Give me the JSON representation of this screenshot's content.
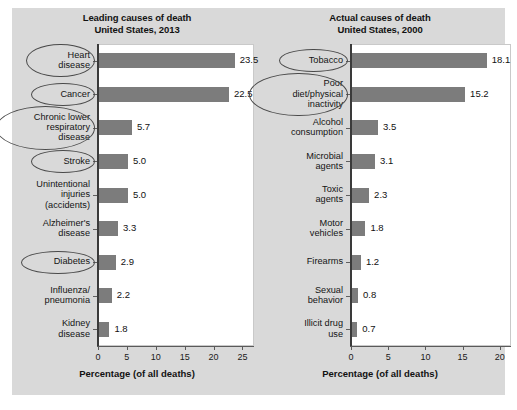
{
  "figure": {
    "panel_color": "#d9d9d9",
    "bar_color": "#7c7c7c",
    "plot_background": "#ffffff",
    "annotation_color": "#4a4a4a"
  },
  "charts": [
    {
      "id": "leading-causes",
      "title_line1": "Leading causes of death",
      "title_line2": "United States, 2013",
      "xlabel": "Percentage (of all deaths)",
      "ticks": [
        "0",
        "5",
        "10",
        "15",
        "20",
        "25"
      ],
      "categories": [
        "Heart disease",
        "Cancer",
        "Chronic lower respiratory disease",
        "Stroke",
        "Unintentional injuries (accidents)",
        "Alzheimer's disease",
        "Diabetes",
        "Influenza/ pneumonia",
        "Kidney disease"
      ],
      "label_lines": [
        [
          "Heart",
          "disease"
        ],
        [
          "Cancer"
        ],
        [
          "Chronic lower",
          "respiratory",
          "disease"
        ],
        [
          "Stroke"
        ],
        [
          "Unintentional",
          "injuries",
          "(accidents)"
        ],
        [
          "Alzheimer's",
          "disease"
        ],
        [
          "Diabetes"
        ],
        [
          "Influenza/",
          "pneumonia"
        ],
        [
          "Kidney",
          "disease"
        ]
      ],
      "values": [
        "23.5",
        "22.5",
        "5.7",
        "5.0",
        "5.0",
        "3.3",
        "2.9",
        "2.2",
        "1.8"
      ],
      "circled": [
        true,
        true,
        true,
        true,
        false,
        false,
        true,
        false,
        false
      ]
    },
    {
      "id": "actual-causes",
      "title_line1": "Actual causes of death",
      "title_line2": "United States, 2000",
      "xlabel": "Percentage (of all deaths)",
      "ticks": [
        "0",
        "5",
        "10",
        "15",
        "20"
      ],
      "categories": [
        "Tobacco",
        "Poor diet/physical inactivity",
        "Alcohol consumption",
        "Microbial agents",
        "Toxic agents",
        "Motor vehicles",
        "Firearms",
        "Sexual behavior",
        "Illicit drug use"
      ],
      "label_lines": [
        [
          "Tobacco"
        ],
        [
          "Poor",
          "diet/physical",
          "inactivity"
        ],
        [
          "Alcohol",
          "consumption"
        ],
        [
          "Microbial",
          "agents"
        ],
        [
          "Toxic",
          "agents"
        ],
        [
          "Motor",
          "vehicles"
        ],
        [
          "Firearms"
        ],
        [
          "Sexual",
          "behavior"
        ],
        [
          "Illicit drug",
          "use"
        ]
      ],
      "values": [
        "18.1",
        "15.2",
        "3.5",
        "3.1",
        "2.3",
        "1.8",
        "1.2",
        "0.8",
        "0.7"
      ],
      "circled": [
        true,
        true,
        false,
        false,
        false,
        false,
        false,
        false,
        false
      ]
    }
  ],
  "chart_data": [
    {
      "type": "bar",
      "orientation": "horizontal",
      "title": "Leading causes of death United States, 2013",
      "xlabel": "Percentage (of all deaths)",
      "ylabel": "",
      "xlim": [
        0,
        27
      ],
      "xticks": [
        0,
        5,
        10,
        15,
        20,
        25
      ],
      "grid": false,
      "legend": false,
      "categories": [
        "Heart disease",
        "Cancer",
        "Chronic lower respiratory disease",
        "Stroke",
        "Unintentional injuries (accidents)",
        "Alzheimer's disease",
        "Diabetes",
        "Influenza/pneumonia",
        "Kidney disease"
      ],
      "values": [
        23.5,
        22.5,
        5.7,
        5.0,
        5.0,
        3.3,
        2.9,
        2.2,
        1.8
      ],
      "data_labels": [
        "23.5",
        "22.5",
        "5.7",
        "5.0",
        "5.0",
        "3.3",
        "2.9",
        "2.2",
        "1.8"
      ],
      "annotations": [
        "ellipse around Heart disease",
        "ellipse around Cancer",
        "ellipse around Chronic lower respiratory disease",
        "ellipse around Stroke",
        "ellipse around Diabetes"
      ]
    },
    {
      "type": "bar",
      "orientation": "horizontal",
      "title": "Actual causes of death United States, 2000",
      "xlabel": "Percentage (of all deaths)",
      "ylabel": "",
      "xlim": [
        0,
        21.5
      ],
      "xticks": [
        0,
        5,
        10,
        15,
        20
      ],
      "grid": false,
      "legend": false,
      "categories": [
        "Tobacco",
        "Poor diet/physical inactivity",
        "Alcohol consumption",
        "Microbial agents",
        "Toxic agents",
        "Motor vehicles",
        "Firearms",
        "Sexual behavior",
        "Illicit drug use"
      ],
      "values": [
        18.1,
        15.2,
        3.5,
        3.1,
        2.3,
        1.8,
        1.2,
        0.8,
        0.7
      ],
      "data_labels": [
        "18.1",
        "15.2",
        "3.5",
        "3.1",
        "2.3",
        "1.8",
        "1.2",
        "0.8",
        "0.7"
      ],
      "annotations": [
        "ellipse around Tobacco",
        "ellipse around Poor diet/physical inactivity"
      ]
    }
  ]
}
